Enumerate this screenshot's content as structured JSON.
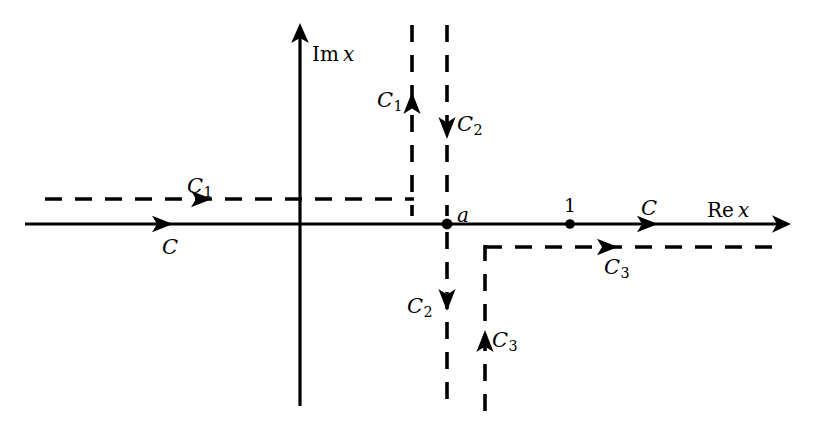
{
  "figure": {
    "background_color": "#ffffff",
    "line_color": "#000000",
    "width": 822,
    "height": 423
  },
  "axes": {
    "real": {
      "label_prefix": "Re",
      "label_var": "x",
      "label_full": "Re x",
      "y": 224,
      "x_start": 25,
      "x_end": 790
    },
    "imaginary": {
      "label_prefix": "Im",
      "label_var": "x",
      "label_full": "Im x",
      "x": 300,
      "y_top": 23,
      "y_bottom": 406
    }
  },
  "points": [
    {
      "name": "branch-point-a",
      "label": "a",
      "x": 447,
      "y": 224
    },
    {
      "name": "unit-point-1",
      "label": "1",
      "x": 570,
      "y": 224
    }
  ],
  "contours": {
    "C": {
      "label": "C",
      "subscript": "",
      "description": "original contour along the real axis, rightward"
    },
    "C1": {
      "label": "C",
      "subscript": "1",
      "description": "deformed contour: from left along y above axis, then up the vertical line left of a"
    },
    "C2": {
      "label": "C",
      "subscript": "2",
      "description": "vertical line through a, descending from top to bottom"
    },
    "C3": {
      "label": "C",
      "subscript": "3",
      "description": "from bottom up the vertical line right of a, then rightward below the axis"
    }
  },
  "labels": [
    {
      "name": "label-im-axis",
      "text": "Im x",
      "x": 312,
      "y": 44,
      "kind": "axis"
    },
    {
      "name": "label-re-axis",
      "text": "Re x",
      "x": 707,
      "y": 200,
      "kind": "axis"
    },
    {
      "name": "label-point-a",
      "text": "a",
      "x": 457,
      "y": 206,
      "kind": "point"
    },
    {
      "name": "label-point-1",
      "text": "1",
      "x": 565,
      "y": 197,
      "kind": "number"
    },
    {
      "name": "label-C-axis",
      "text": "C",
      "x": 641,
      "y": 199,
      "kind": "contour"
    },
    {
      "name": "label-C-below-axis",
      "text": "C",
      "x": 163,
      "y": 238,
      "kind": "contour"
    },
    {
      "name": "label-C1-horizontal",
      "text": "C1",
      "x": 188,
      "y": 177,
      "kind": "contour"
    },
    {
      "name": "label-C1-vertical",
      "text": "C1",
      "x": 378,
      "y": 91,
      "kind": "contour"
    },
    {
      "name": "label-C2-upper",
      "text": "C2",
      "x": 457,
      "y": 115,
      "kind": "contour"
    },
    {
      "name": "label-C2-lower",
      "text": "C2",
      "x": 408,
      "y": 297,
      "kind": "contour"
    },
    {
      "name": "label-C3-horizontal",
      "text": "C3",
      "x": 605,
      "y": 258,
      "kind": "contour"
    },
    {
      "name": "label-C3-vertical",
      "text": "C3",
      "x": 492,
      "y": 331,
      "kind": "contour"
    }
  ],
  "geometry": {
    "dash_pattern": "17 13",
    "solid_width": 3.2,
    "dashed_width": 3.6,
    "C1_horizontal_y": 199,
    "C1_horizontal_x_start": 45,
    "C1_vertical_x": 412,
    "C1_vertical_y_top": 25,
    "C2_vertical_x": 447,
    "C2_vertical_y_top": 25,
    "C2_vertical_y_bottom": 411,
    "C3_vertical_x": 485,
    "C3_vertical_y_bottom": 411,
    "C3_horizontal_y": 247,
    "C3_horizontal_x_end": 778
  }
}
